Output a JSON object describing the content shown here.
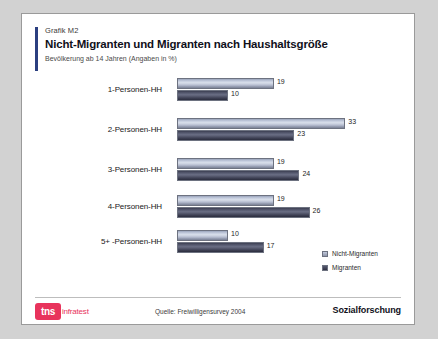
{
  "header": {
    "kicker": "Grafik M2",
    "title": "Nicht-Migranten und Migranten nach Haushaltsgröße",
    "subtitle": "Bevölkerung ab 14 Jahren (Angaben in %)"
  },
  "footer": {
    "logo_mark": "tns",
    "logo_word": "infratest",
    "source": "Quelle: Freiwilligensurvey 2004",
    "department": "Sozialforschung"
  },
  "colors": {
    "accent_navy": "#2b3f80",
    "brand_red": "#e8335c",
    "series_light": "#c3cbdd",
    "series_dark": "#4b4e62",
    "card_background": "#ffffff",
    "page_background": "#d2d2d2"
  },
  "chart_data": {
    "type": "bar",
    "orientation": "horizontal",
    "title": "Nicht-Migranten und Migranten nach Haushaltsgröße",
    "subtitle": "Bevölkerung ab 14 Jahren (Angaben in %)",
    "xlabel": "",
    "ylabel": "",
    "xlim": [
      0,
      33
    ],
    "grid": false,
    "legend_position": "right",
    "categories": [
      "1-Personen-HH",
      "2-Personen-HH",
      "3-Personen-HH",
      "4-Personen-HH",
      "5+ -Personen-HH"
    ],
    "series": [
      {
        "name": "Nicht-Migranten",
        "values": [
          19,
          33,
          19,
          19,
          10
        ]
      },
      {
        "name": "Migranten",
        "values": [
          10,
          23,
          24,
          26,
          17
        ]
      }
    ]
  }
}
